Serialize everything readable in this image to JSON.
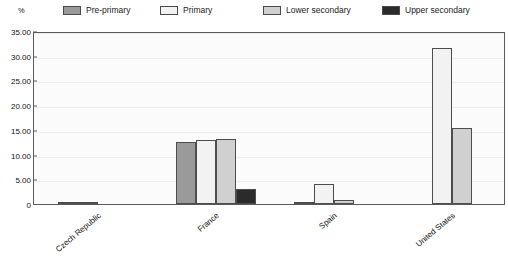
{
  "chart_data": {
    "type": "bar",
    "title": "",
    "xlabel": "",
    "ylabel": "%",
    "ylim": [
      0,
      35
    ],
    "ytick_values": [
      0,
      5,
      10,
      15,
      20,
      25,
      30,
      35
    ],
    "ytick_labels": [
      "0",
      "5.00",
      "10.00",
      "15.00",
      "20.00",
      "25.00",
      "30.00",
      "35.00"
    ],
    "grid": true,
    "legend_position": "top",
    "categories": [
      "Czech Republic",
      "France",
      "Spain",
      "United States"
    ],
    "series": [
      {
        "name": "Pre-primary",
        "color": "#9a9a9a",
        "values": [
          0.4,
          12.6,
          0.5,
          0.0
        ]
      },
      {
        "name": "Primary",
        "color": "#f2f2f2",
        "values": [
          0.15,
          12.9,
          4.0,
          31.5
        ]
      },
      {
        "name": "Lower secondary",
        "color": "#d0d0d0",
        "values": [
          0.0,
          13.2,
          0.9,
          15.3
        ]
      },
      {
        "name": "Upper secondary",
        "color": "#2b2b2b",
        "values": [
          0.0,
          3.0,
          0.0,
          0.0
        ]
      }
    ]
  },
  "legend": {
    "items": [
      {
        "label": "Pre-primary",
        "color": "#9a9a9a"
      },
      {
        "label": "Primary",
        "color": "#f2f2f2"
      },
      {
        "label": "Lower secondary",
        "color": "#d0d0d0"
      },
      {
        "label": "Upper secondary",
        "color": "#2b2b2b"
      }
    ]
  },
  "axis": {
    "unit_label": "%"
  }
}
